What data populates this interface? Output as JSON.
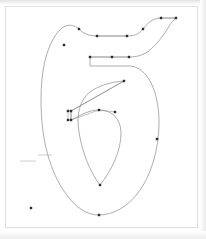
{
  "app": {
    "title": "Glyph Outline Editor",
    "glyph_name": "six",
    "glyph_character": "6",
    "view_mode": "outline"
  },
  "canvas": {
    "width": 206,
    "height": 239,
    "frame": {
      "x": 5,
      "y": 6,
      "width": 193,
      "height": 222
    },
    "background_color": "#ffffff",
    "frame_border_color": "#e0e0e0"
  },
  "style": {
    "outline_stroke_color": "#8a8a8a",
    "handle_line_color": "#9a9a9a",
    "point_fill_color": "#2b2b2b",
    "guide_color": "#c8c8c8",
    "outline_stroke_width": 0.7,
    "handle_stroke_width": 0.6,
    "point_size": 2.4
  },
  "guides": [
    {
      "name": "guide-baseline",
      "x1": 20,
      "y1": 161,
      "x2": 36,
      "y2": 161
    },
    {
      "name": "guide-xheight",
      "x1": 38,
      "y1": 155,
      "x2": 52,
      "y2": 155
    }
  ],
  "contours": [
    {
      "name": "outer-contour",
      "path": "M 176 18 L 161 18 C 152 18 147 24 143 29 C 139 34 135 36 127 36 L 97 36 C 88 36 83 33 79 29 C 70 22 62 25 55 36 C 46 50 41 71 41 100 C 41 140 50 172 66 194 C 76 208 87 215 99 215 C 113 215 127 207 138 193 C 151 176 159 149 159 123 C 159 100 153 81 143 72 L 143 72 C 139 68 134 66 129 66 L 90 66 L 90 57 L 129 57 C 137 57 144 55 150 50 C 157 44 163 36 168 28 C 171 23 173 20 176 18 Z"
    },
    {
      "name": "inner-counter-contour",
      "path": "M 124 81 L 71 111 L 71 120 L 77 117 C 86 112 93 110 99 110 C 112 110 121 119 121 133 C 121 151 112 170 100 185 C 90 172 82 152 79 132 C 76 114 80 100 90 92 C 98 86 110 82 124 81 Z"
    }
  ],
  "handles": [
    {
      "name": "handle-top-right",
      "x1": 176,
      "y1": 18,
      "x2": 161,
      "y2": 18
    },
    {
      "name": "handle-top-shoulder",
      "x1": 127,
      "y1": 36,
      "x2": 97,
      "y2": 36
    },
    {
      "name": "handle-mid-bar",
      "x1": 129,
      "y1": 57,
      "x2": 90,
      "y2": 57
    },
    {
      "name": "handle-counter-top",
      "x1": 124,
      "y1": 81,
      "x2": 71,
      "y2": 111
    },
    {
      "name": "handle-counter-stem",
      "x1": 71,
      "y1": 111,
      "x2": 71,
      "y2": 120
    },
    {
      "name": "handle-counter-stem-outer",
      "x1": 68,
      "y1": 111,
      "x2": 68,
      "y2": 120
    },
    {
      "name": "handle-counter-inner-bar",
      "x1": 71,
      "y1": 120,
      "x2": 99,
      "y2": 110
    },
    {
      "name": "handle-counter-inner-bar-2",
      "x1": 99,
      "y1": 110,
      "x2": 115,
      "y2": 112
    }
  ],
  "points": [
    {
      "name": "point-terminal-right",
      "x": 176,
      "y": 18,
      "type": "on-curve"
    },
    {
      "name": "point-terminal-left",
      "x": 161,
      "y": 18,
      "type": "on-curve"
    },
    {
      "name": "point-top-curve-right",
      "x": 143,
      "y": 29,
      "type": "off-curve"
    },
    {
      "name": "point-top-shoulder-right",
      "x": 127,
      "y": 36,
      "type": "on-curve"
    },
    {
      "name": "point-top-shoulder-left",
      "x": 97,
      "y": 36,
      "type": "on-curve"
    },
    {
      "name": "point-top-left-curve",
      "x": 79,
      "y": 29,
      "type": "off-curve"
    },
    {
      "name": "point-upper-left-stem",
      "x": 64,
      "y": 45,
      "type": "on-curve"
    },
    {
      "name": "point-bar-right",
      "x": 129,
      "y": 57,
      "type": "on-curve"
    },
    {
      "name": "point-bar-mid",
      "x": 112,
      "y": 57,
      "type": "off-curve"
    },
    {
      "name": "point-bar-left",
      "x": 90,
      "y": 57,
      "type": "on-curve"
    },
    {
      "name": "point-counter-top",
      "x": 124,
      "y": 81,
      "type": "on-curve"
    },
    {
      "name": "point-counter-stem-top-inner",
      "x": 71,
      "y": 111,
      "type": "on-curve"
    },
    {
      "name": "point-counter-stem-top-outer",
      "x": 68,
      "y": 111,
      "type": "off-curve"
    },
    {
      "name": "point-counter-stem-bottom-inner",
      "x": 71,
      "y": 120,
      "type": "on-curve"
    },
    {
      "name": "point-counter-stem-bottom-outer",
      "x": 68,
      "y": 120,
      "type": "off-curve"
    },
    {
      "name": "point-counter-inner-left",
      "x": 99,
      "y": 110,
      "type": "on-curve"
    },
    {
      "name": "point-counter-inner-right",
      "x": 115,
      "y": 112,
      "type": "on-curve"
    },
    {
      "name": "point-counter-bottom",
      "x": 100,
      "y": 185,
      "type": "on-curve"
    },
    {
      "name": "point-bowl-right",
      "x": 157,
      "y": 139,
      "type": "off-curve"
    },
    {
      "name": "point-bowl-bottom",
      "x": 99,
      "y": 215,
      "type": "on-curve"
    },
    {
      "name": "point-stray-anchor",
      "x": 31,
      "y": 208,
      "type": "on-curve"
    }
  ]
}
